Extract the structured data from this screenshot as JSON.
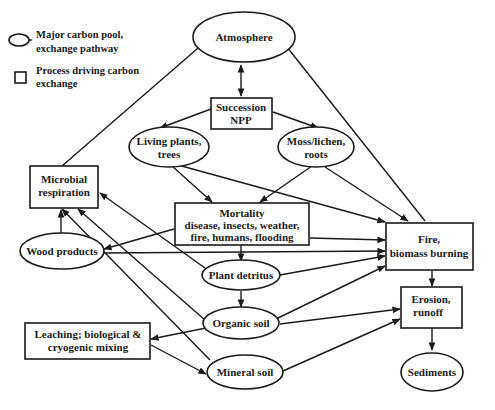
{
  "legend": {
    "pool_line1": "Major carbon pool,",
    "pool_line2": "exchange pathway",
    "process_line1": "Process driving carbon",
    "process_line2": "exchange"
  },
  "nodes": {
    "atmosphere": "Atmosphere",
    "succession_line1": "Succession",
    "succession_line2": "NPP",
    "living_plants_line1": "Living plants,",
    "living_plants_line2": "trees",
    "moss_line1": "Moss/lichen,",
    "moss_line2": "roots",
    "microbial_line1": "Microbial",
    "microbial_line2": "respiration",
    "mortality_line1": "Mortality",
    "mortality_line2": "disease, insects, weather,",
    "mortality_line3": "fire, humans, flooding",
    "wood_products": "Wood products",
    "plant_detritus": "Plant detritus",
    "fire_line1": "Fire,",
    "fire_line2": "biomass burning",
    "organic_soil": "Organic soil",
    "erosion_line1": "Erosion,",
    "erosion_line2": "runoff",
    "leaching_line1": "Leaching; biological &",
    "leaching_line2": "cryogenic mixing",
    "mineral_soil": "Mineral soil",
    "sediments": "Sediments"
  },
  "colors": {
    "stroke": "#1a1a1a",
    "background": "#ffffff"
  }
}
